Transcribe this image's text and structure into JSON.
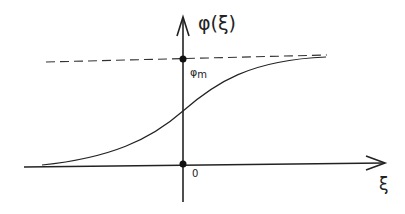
{
  "diagram": {
    "type": "sigmoid-curve-plot",
    "y_axis_label": "φ(ξ)",
    "x_axis_label": "ξ",
    "origin_label": "0",
    "asymptote_label": "φm",
    "asymptote_label_base": "φ",
    "asymptote_label_sub": "m",
    "asymptote_style": "dashed",
    "colors": {
      "ink": "#222222",
      "background": "#ffffff"
    }
  }
}
